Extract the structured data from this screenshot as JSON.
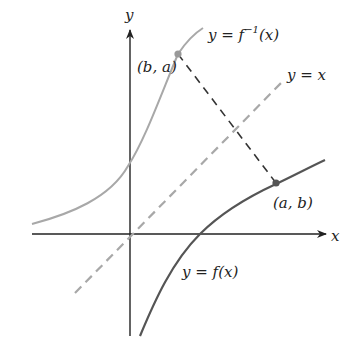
{
  "figure": {
    "axes": {
      "x_label": "x",
      "y_label": "y"
    },
    "curves": {
      "inverse": {
        "label_prefix": "y = f",
        "label_sup": "−1",
        "label_suffix": "(x)",
        "color": "#a8a8a8"
      },
      "function": {
        "label": "y = f(x)",
        "color": "#555555"
      },
      "identity": {
        "label": "y = x",
        "color": "#a8a8a8",
        "style": "dashed"
      }
    },
    "points": {
      "inverse_point": {
        "label": "(b, a)",
        "color": "#999999"
      },
      "function_point": {
        "label": "(a, b)",
        "color": "#555555"
      }
    },
    "connector": {
      "style": "dashed",
      "color": "#333333"
    },
    "colors": {
      "axis": "#222222",
      "background": "#ffffff"
    }
  }
}
